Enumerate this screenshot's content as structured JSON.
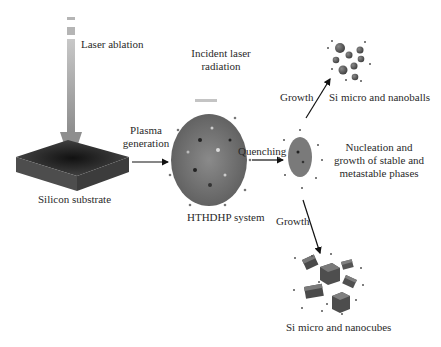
{
  "labels": {
    "laser_ablation": "Laser ablation",
    "incident_laser_line1": "Incident laser",
    "incident_laser_line2": "radiation",
    "plasma_line1": "Plasma",
    "plasma_line2": "generation",
    "silicon_substrate": "Silicon substrate",
    "hthdhp": "HTHDHP system",
    "quenching": "Quenching",
    "growth_up": "Growth",
    "growth_down": "Growth",
    "nanoballs": "Si micro and nanoballs",
    "nucleation_line1": "Nucleation and",
    "nucleation_line2": "growth of stable and",
    "nucleation_line3": "metastable phases",
    "nanocubes": "Si micro and nanocubes"
  },
  "colors": {
    "laser_beam": "#a9a9a9",
    "substrate_top": "#3a3a3a",
    "substrate_side": "#555555",
    "plasma": "#6f6f6f",
    "particle": "#606060",
    "arrow": "#111111"
  }
}
